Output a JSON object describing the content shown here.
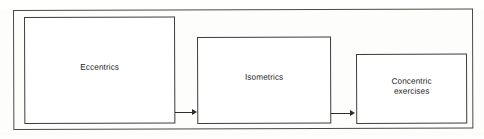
{
  "diagram": {
    "type": "flowchart",
    "orientation": "left-to-right",
    "title": "",
    "frame": {
      "name": "outer-container",
      "stroke_color": "#4a4a4a"
    },
    "nodes": [
      {
        "id": "eccentrics",
        "label": "Eccentrics",
        "shape": "rectangle",
        "stroke_color": "#3d3d3d",
        "fill_color": "#ffffff"
      },
      {
        "id": "isometrics",
        "label": "Isometrics",
        "shape": "rectangle",
        "stroke_color": "#3d3d3d",
        "fill_color": "#ffffff"
      },
      {
        "id": "concentric",
        "label": "Concentric\nexercises",
        "shape": "rectangle",
        "stroke_color": "#3d3d3d",
        "fill_color": "#ffffff"
      }
    ],
    "edges": [
      {
        "id": "eccentrics-to-isometrics",
        "from": "eccentrics",
        "to": "isometrics",
        "style": "solid-arrow",
        "label": "",
        "stroke_color": "#2b2b2b"
      },
      {
        "id": "isometrics-to-concentric",
        "from": "isometrics",
        "to": "concentric",
        "style": "solid-arrow",
        "label": "",
        "stroke_color": "#2b2b2b"
      }
    ]
  }
}
